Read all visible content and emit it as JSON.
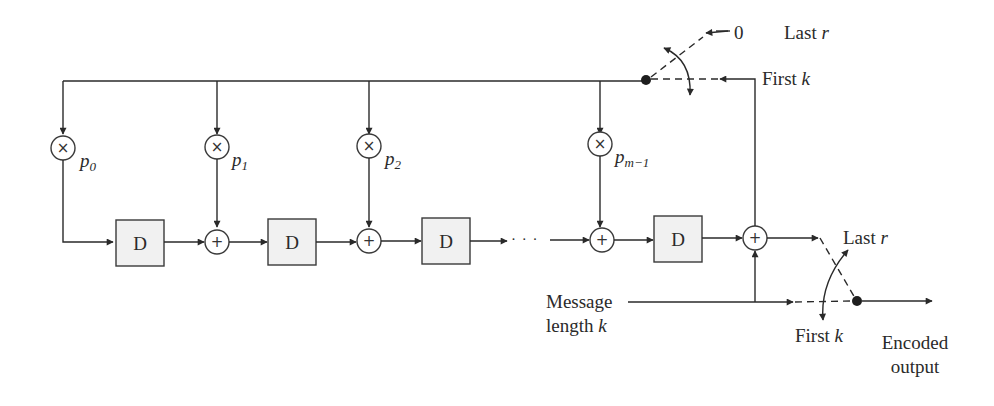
{
  "diagram": {
    "type": "block-diagram",
    "multipliers": [
      {
        "label": "p",
        "sub": "0"
      },
      {
        "label": "p",
        "sub": "1"
      },
      {
        "label": "p",
        "sub": "2"
      },
      {
        "label": "p",
        "sub": "m−1"
      }
    ],
    "delay_label": "D",
    "delays_count": 4,
    "adder_symbol": "+",
    "multiplier_symbol": "×",
    "ellipsis": "· · ·",
    "feedback_switch": {
      "zero_label": "0",
      "last_label": "Last",
      "last_var": "r",
      "first_label": "First",
      "first_var": "k"
    },
    "output_switch": {
      "last_label": "Last",
      "last_var": "r",
      "first_label": "First",
      "first_var": "k"
    },
    "input": {
      "line1": "Message",
      "line2": "length",
      "var": "k"
    },
    "output": {
      "line1": "Encoded",
      "line2": "output"
    },
    "colors": {
      "stroke": "#2a2a2a",
      "delay_fill": "#f1f1f1",
      "background": "#ffffff"
    }
  }
}
